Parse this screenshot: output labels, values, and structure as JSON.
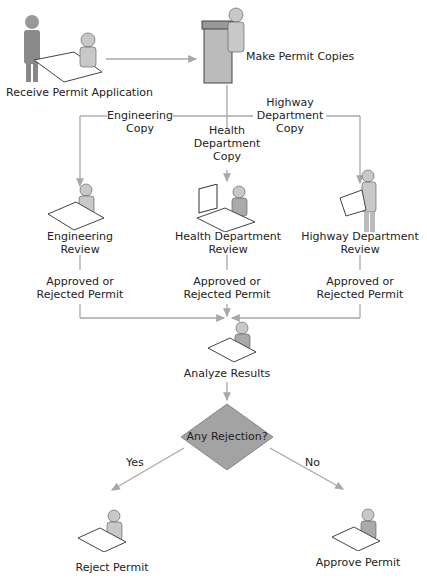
{
  "nodes": {
    "receive": {
      "label": "Receive Permit Application"
    },
    "copies": {
      "label": "Make Permit Copies"
    },
    "eng_copy": {
      "line1": "Engineering",
      "line2": "Copy"
    },
    "health_copy": {
      "line1": "Health",
      "line2": "Department",
      "line3": "Copy"
    },
    "highway_copy": {
      "line1": "Highway",
      "line2": "Department",
      "line3": "Copy"
    },
    "eng_review": {
      "line1": "Engineering",
      "line2": "Review"
    },
    "health_review": {
      "line1": "Health Department",
      "line2": "Review"
    },
    "highway_review": {
      "line1": "Highway Department",
      "line2": "Review"
    },
    "eng_result": {
      "line1": "Approved or",
      "line2": "Rejected Permit"
    },
    "health_result": {
      "line1": "Approved or",
      "line2": "Rejected Permit"
    },
    "highway_result": {
      "line1": "Approved or",
      "line2": "Rejected Permit"
    },
    "analyze": {
      "label": "Analyze Results"
    },
    "decision": {
      "label": "Any Rejection?"
    },
    "yes": {
      "label": "Yes"
    },
    "no": {
      "label": "No"
    },
    "reject": {
      "label": "Reject Permit"
    },
    "approve": {
      "label": "Approve Permit"
    }
  },
  "colors": {
    "line": "#a8a8a8",
    "diamond": "#a3a3a3",
    "figure": "#b5b5b5",
    "text": "#222222"
  }
}
